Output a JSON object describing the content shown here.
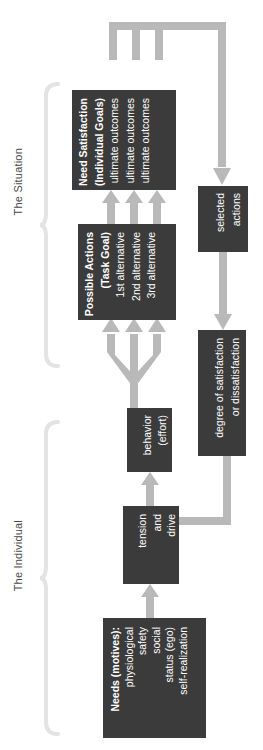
{
  "diagram": {
    "orientation": "rotated-90-ccw",
    "colors": {
      "box_fill": "#3b3b3b",
      "box_text": "#ffffff",
      "arrow": "#b9b9b9",
      "bracket": "#e2e2e2",
      "label_text": "#4a4a4a",
      "background": "#ffffff"
    },
    "brackets": [
      {
        "id": "individual",
        "label": "The Individual"
      },
      {
        "id": "situation",
        "label": "The Situation"
      }
    ],
    "nodes": [
      {
        "id": "needs",
        "lines": [
          "Needs (motives):",
          "physiological",
          "safety",
          "social",
          "status (ego)",
          "self-realization"
        ]
      },
      {
        "id": "tension",
        "lines": [
          "tension",
          "and",
          "drive"
        ]
      },
      {
        "id": "behavior",
        "lines": [
          "behavior",
          "(effort)"
        ]
      },
      {
        "id": "possible-actions",
        "lines": [
          "Possible Actions",
          "(Task Goal)",
          "1st alternative",
          "2nd alternative",
          "3rd alternative"
        ]
      },
      {
        "id": "need-satisfaction",
        "lines": [
          "Need Satisfaction",
          "(Individual Goals)",
          "ultimate outcomes",
          "ultimate outcomes",
          "ultimate outcomes"
        ]
      },
      {
        "id": "selected-actions",
        "lines": [
          "selected",
          "actions"
        ]
      },
      {
        "id": "degree",
        "lines": [
          "degree of satisfaction",
          "or dissatisfaction"
        ]
      }
    ],
    "edges": [
      {
        "id": "needs-to-tension",
        "from": "needs",
        "to": "tension",
        "kind": "arrow"
      },
      {
        "id": "tension-to-behavior",
        "from": "tension",
        "to": "behavior",
        "kind": "arrow"
      },
      {
        "id": "behavior-to-alternatives",
        "from": "behavior",
        "to": "possible-actions",
        "kind": "trident-fan",
        "branches": 3
      },
      {
        "id": "alternatives-to-outcomes",
        "from": "possible-actions",
        "to": "need-satisfaction",
        "kind": "arrow",
        "branches": 3
      },
      {
        "id": "outcomes-to-selected",
        "from": "need-satisfaction",
        "to": "selected-actions",
        "kind": "manifold-arrow",
        "branches": 3
      },
      {
        "id": "selected-to-degree",
        "from": "selected-actions",
        "to": "degree",
        "kind": "arrow"
      },
      {
        "id": "degree-to-tension",
        "from": "degree",
        "to": "tension",
        "kind": "feedback-arrow"
      }
    ]
  }
}
